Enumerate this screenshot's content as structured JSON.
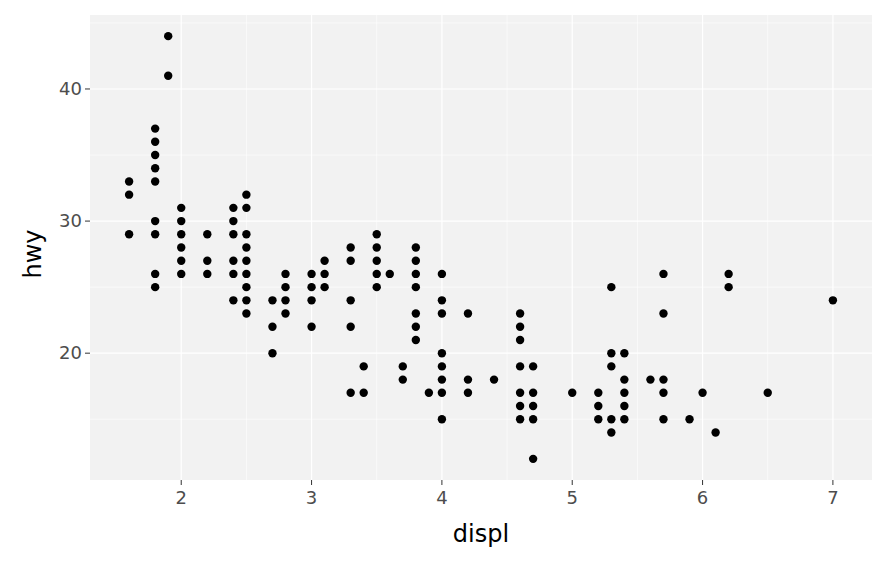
{
  "chart_data": {
    "type": "scatter",
    "title": "",
    "xlabel": "displ",
    "ylabel": "hwy",
    "xlim": [
      1.3,
      7.3
    ],
    "ylim": [
      10.4,
      45.6
    ],
    "x_ticks": [
      2,
      3,
      4,
      5,
      6,
      7
    ],
    "y_ticks": [
      20,
      30,
      40
    ],
    "grid": true,
    "legend": "none",
    "point_color": "#000000",
    "panel_background": "#f2f2f2",
    "grid_color": "#ffffff",
    "tick_label_color": "#4d4d4d",
    "points": [
      [
        1.6,
        33
      ],
      [
        1.6,
        32
      ],
      [
        1.6,
        29
      ],
      [
        1.8,
        37
      ],
      [
        1.8,
        36
      ],
      [
        1.8,
        35
      ],
      [
        1.8,
        34
      ],
      [
        1.8,
        33
      ],
      [
        1.8,
        30
      ],
      [
        1.8,
        29
      ],
      [
        1.8,
        26
      ],
      [
        1.8,
        25
      ],
      [
        1.9,
        44
      ],
      [
        1.9,
        41
      ],
      [
        2.0,
        31
      ],
      [
        2.0,
        30
      ],
      [
        2.0,
        29
      ],
      [
        2.0,
        28
      ],
      [
        2.0,
        27
      ],
      [
        2.0,
        26
      ],
      [
        2.2,
        29
      ],
      [
        2.2,
        27
      ],
      [
        2.2,
        26
      ],
      [
        2.4,
        31
      ],
      [
        2.4,
        30
      ],
      [
        2.4,
        29
      ],
      [
        2.4,
        27
      ],
      [
        2.4,
        26
      ],
      [
        2.4,
        24
      ],
      [
        2.5,
        32
      ],
      [
        2.5,
        31
      ],
      [
        2.5,
        29
      ],
      [
        2.5,
        28
      ],
      [
        2.5,
        27
      ],
      [
        2.5,
        26
      ],
      [
        2.5,
        25
      ],
      [
        2.5,
        24
      ],
      [
        2.5,
        23
      ],
      [
        2.7,
        24
      ],
      [
        2.7,
        22
      ],
      [
        2.7,
        20
      ],
      [
        2.8,
        26
      ],
      [
        2.8,
        25
      ],
      [
        2.8,
        24
      ],
      [
        2.8,
        23
      ],
      [
        3.0,
        26
      ],
      [
        3.0,
        25
      ],
      [
        3.0,
        24
      ],
      [
        3.0,
        22
      ],
      [
        3.1,
        27
      ],
      [
        3.1,
        26
      ],
      [
        3.1,
        25
      ],
      [
        3.3,
        28
      ],
      [
        3.3,
        27
      ],
      [
        3.3,
        24
      ],
      [
        3.3,
        22
      ],
      [
        3.3,
        17
      ],
      [
        3.4,
        19
      ],
      [
        3.4,
        17
      ],
      [
        3.5,
        29
      ],
      [
        3.5,
        28
      ],
      [
        3.5,
        27
      ],
      [
        3.5,
        26
      ],
      [
        3.5,
        25
      ],
      [
        3.6,
        26
      ],
      [
        3.7,
        19
      ],
      [
        3.7,
        18
      ],
      [
        3.8,
        28
      ],
      [
        3.8,
        27
      ],
      [
        3.8,
        26
      ],
      [
        3.8,
        25
      ],
      [
        3.8,
        23
      ],
      [
        3.8,
        22
      ],
      [
        3.8,
        21
      ],
      [
        3.9,
        17
      ],
      [
        4.0,
        26
      ],
      [
        4.0,
        24
      ],
      [
        4.0,
        23
      ],
      [
        4.0,
        20
      ],
      [
        4.0,
        19
      ],
      [
        4.0,
        18
      ],
      [
        4.0,
        17
      ],
      [
        4.0,
        15
      ],
      [
        4.2,
        23
      ],
      [
        4.2,
        18
      ],
      [
        4.2,
        17
      ],
      [
        4.4,
        18
      ],
      [
        4.6,
        23
      ],
      [
        4.6,
        22
      ],
      [
        4.6,
        21
      ],
      [
        4.6,
        19
      ],
      [
        4.6,
        17
      ],
      [
        4.6,
        16
      ],
      [
        4.6,
        15
      ],
      [
        4.7,
        19
      ],
      [
        4.7,
        17
      ],
      [
        4.7,
        16
      ],
      [
        4.7,
        15
      ],
      [
        4.7,
        12
      ],
      [
        5.0,
        17
      ],
      [
        5.2,
        17
      ],
      [
        5.2,
        16
      ],
      [
        5.2,
        15
      ],
      [
        5.3,
        25
      ],
      [
        5.3,
        20
      ],
      [
        5.3,
        19
      ],
      [
        5.3,
        15
      ],
      [
        5.3,
        14
      ],
      [
        5.4,
        20
      ],
      [
        5.4,
        18
      ],
      [
        5.4,
        17
      ],
      [
        5.4,
        16
      ],
      [
        5.4,
        15
      ],
      [
        5.6,
        18
      ],
      [
        5.7,
        26
      ],
      [
        5.7,
        23
      ],
      [
        5.7,
        18
      ],
      [
        5.7,
        17
      ],
      [
        5.7,
        15
      ],
      [
        5.9,
        15
      ],
      [
        6.0,
        17
      ],
      [
        6.1,
        14
      ],
      [
        6.2,
        26
      ],
      [
        6.2,
        25
      ],
      [
        6.5,
        17
      ],
      [
        7.0,
        24
      ]
    ]
  }
}
